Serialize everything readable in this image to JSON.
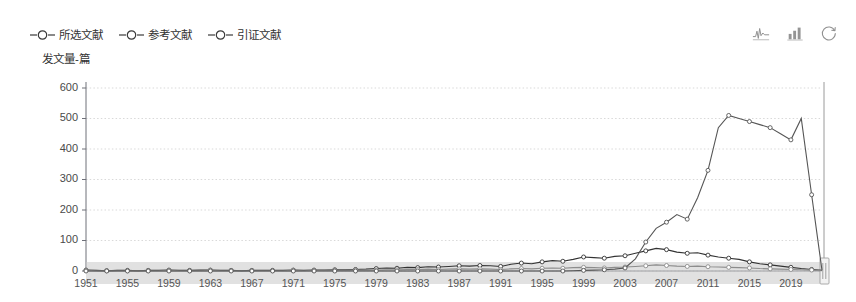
{
  "legend": {
    "items": [
      {
        "label": "所选文献",
        "name": "legend-item-selected-literature",
        "color": "#333333"
      },
      {
        "label": "参考文献",
        "name": "legend-item-references",
        "color": "#7f7f7f"
      },
      {
        "label": "引证文献",
        "name": "legend-item-citations",
        "color": "#5a5a5a"
      }
    ]
  },
  "toolbox": {
    "icons": [
      {
        "name": "line-chart-icon",
        "title": "切换为折线图"
      },
      {
        "name": "bar-chart-icon",
        "title": "切换为柱状图"
      },
      {
        "name": "refresh-icon",
        "title": "还原"
      }
    ]
  },
  "datazoom": {
    "start_label": "1951",
    "end_label": "2022",
    "handle_name": "datazoom-right-handle"
  },
  "chart_data": {
    "type": "line",
    "title": "",
    "ylabel": "发文量-篇",
    "xlabel": "",
    "ylim": [
      0,
      600
    ],
    "yticks": [
      0,
      100,
      200,
      300,
      400,
      500,
      600
    ],
    "xticks": [
      "1951",
      "1955",
      "1959",
      "1963",
      "1967",
      "1971",
      "1975",
      "1979",
      "1983",
      "1987",
      "1991",
      "1995",
      "1999",
      "2003",
      "2007",
      "2011",
      "2015",
      "2019"
    ],
    "grid": true,
    "legend_position": "top-left",
    "x": [
      1951,
      1952,
      1953,
      1954,
      1955,
      1956,
      1957,
      1958,
      1959,
      1960,
      1961,
      1962,
      1963,
      1964,
      1965,
      1966,
      1967,
      1968,
      1969,
      1970,
      1971,
      1972,
      1973,
      1974,
      1975,
      1976,
      1977,
      1978,
      1979,
      1980,
      1981,
      1982,
      1983,
      1984,
      1985,
      1986,
      1987,
      1988,
      1989,
      1990,
      1991,
      1992,
      1993,
      1994,
      1995,
      1996,
      1997,
      1998,
      1999,
      2000,
      2001,
      2002,
      2003,
      2004,
      2005,
      2006,
      2007,
      2008,
      2009,
      2010,
      2011,
      2012,
      2013,
      2014,
      2015,
      2016,
      2017,
      2018,
      2019,
      2020,
      2021,
      2022
    ],
    "series": [
      {
        "name": "所选文献",
        "color": "#333333",
        "values": [
          3,
          2,
          1,
          2,
          2,
          1,
          2,
          2,
          3,
          2,
          2,
          3,
          3,
          2,
          2,
          1,
          2,
          2,
          2,
          2,
          3,
          2,
          3,
          3,
          4,
          4,
          5,
          6,
          8,
          10,
          9,
          12,
          11,
          14,
          13,
          15,
          17,
          16,
          18,
          17,
          15,
          22,
          26,
          24,
          30,
          34,
          32,
          38,
          46,
          44,
          42,
          48,
          50,
          58,
          66,
          74,
          70,
          62,
          58,
          60,
          52,
          46,
          42,
          38,
          30,
          24,
          20,
          16,
          12,
          8,
          5,
          2
        ]
      },
      {
        "name": "参考文献",
        "color": "#8c8c8c",
        "values": [
          2,
          1,
          1,
          1,
          1,
          1,
          1,
          1,
          2,
          1,
          1,
          1,
          2,
          1,
          1,
          1,
          1,
          1,
          1,
          1,
          2,
          1,
          2,
          2,
          2,
          2,
          3,
          3,
          3,
          4,
          4,
          5,
          5,
          6,
          5,
          6,
          7,
          6,
          7,
          6,
          5,
          7,
          8,
          7,
          9,
          10,
          9,
          11,
          12,
          11,
          10,
          12,
          13,
          15,
          17,
          20,
          18,
          16,
          15,
          16,
          14,
          13,
          12,
          11,
          10,
          8,
          7,
          6,
          5,
          4,
          3,
          1
        ]
      },
      {
        "name": "引证文献",
        "color": "#555555",
        "values": [
          0,
          0,
          0,
          0,
          0,
          0,
          0,
          0,
          0,
          0,
          0,
          0,
          0,
          0,
          0,
          0,
          0,
          0,
          0,
          0,
          0,
          0,
          0,
          0,
          0,
          0,
          0,
          0,
          0,
          0,
          0,
          0,
          0,
          0,
          0,
          0,
          0,
          0,
          0,
          0,
          0,
          0,
          0,
          0,
          0,
          0,
          0,
          1,
          2,
          3,
          4,
          6,
          10,
          40,
          95,
          140,
          160,
          185,
          170,
          240,
          330,
          470,
          510,
          500,
          490,
          480,
          470,
          450,
          430,
          500,
          250,
          2
        ]
      }
    ]
  }
}
